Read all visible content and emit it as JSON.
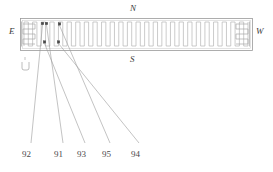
{
  "figure": {
    "type": "patent-technical-drawing",
    "orientation_labels": {
      "north": "N",
      "south": "S",
      "east": "E",
      "west": "W"
    },
    "body": {
      "x": 20,
      "y": 18,
      "width": 232,
      "height": 32,
      "stroke_color": "#9a9a9a",
      "fill_color": "#ffffff"
    },
    "serpentine": {
      "stroke_color": "#b4b4b4",
      "teeth_count": 52,
      "start_x": 24,
      "end_x": 248
    },
    "end_caps": {
      "left_x": 22,
      "right_x": 236,
      "stroke_color": "#a8a8a8",
      "meander_rows": 5
    },
    "markers": [
      {
        "name": "marker-92-top",
        "x": 42.5,
        "y": 23.5,
        "size": 2.6,
        "color": "#4a4a4a"
      },
      {
        "name": "marker-91-top",
        "x": 46.5,
        "y": 23.5,
        "size": 2.6,
        "color": "#4a4a4a"
      },
      {
        "name": "marker-93-bottom",
        "x": 44.5,
        "y": 42.0,
        "size": 2.6,
        "color": "#4a4a4a"
      },
      {
        "name": "marker-95-top",
        "x": 59.5,
        "y": 24.0,
        "size": 2.6,
        "color": "#4a4a4a"
      },
      {
        "name": "marker-94-bottom",
        "x": 58.5,
        "y": 42.0,
        "size": 2.6,
        "color": "#4a4a4a"
      }
    ],
    "leader_lines": [
      {
        "ref": "92",
        "from_x": 42.5,
        "from_y": 25.0,
        "to_x": 31.0,
        "to_y": 143.0
      },
      {
        "ref": "91",
        "from_x": 46.5,
        "from_y": 25.0,
        "to_x": 63.0,
        "to_y": 143.0
      },
      {
        "ref": "93",
        "from_x": 44.5,
        "from_y": 43.5,
        "to_x": 85.0,
        "to_y": 143.0
      },
      {
        "ref": "95",
        "from_x": 59.5,
        "from_y": 25.5,
        "to_x": 110.0,
        "to_y": 143.0
      },
      {
        "ref": "94",
        "from_x": 58.5,
        "from_y": 43.5,
        "to_x": 139.0,
        "to_y": 143.0
      },
      {
        "ref": "tick",
        "from_x": 25.0,
        "from_y": 57.0,
        "to_x": 25.0,
        "to_y": 60.0
      }
    ],
    "leader_stroke_color": "#9a9a9a",
    "reference_numbers": [
      {
        "label": "92",
        "x": 22,
        "y": 150
      },
      {
        "label": "91",
        "x": 54,
        "y": 150
      },
      {
        "label": "93",
        "x": 77,
        "y": 150
      },
      {
        "label": "95",
        "x": 102,
        "y": 150
      },
      {
        "label": "94",
        "x": 131,
        "y": 150
      }
    ],
    "small_hook": {
      "name": "u-shaped-terminal",
      "x": 22,
      "y": 62,
      "width": 7,
      "height": 8,
      "stroke_color": "#a0a0a0"
    }
  }
}
